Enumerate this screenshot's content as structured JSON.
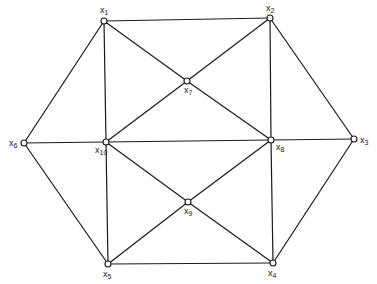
{
  "diagram": {
    "type": "graph",
    "nodes": [
      {
        "id": "x1",
        "label": "x",
        "sub": "1",
        "x": 104,
        "y": 21,
        "lx": 100,
        "ly": 13
      },
      {
        "id": "x2",
        "label": "x",
        "sub": "2",
        "x": 270,
        "y": 18,
        "lx": 266,
        "ly": 11
      },
      {
        "id": "x3",
        "label": "x",
        "sub": "3",
        "x": 354,
        "y": 139,
        "lx": 360,
        "ly": 143
      },
      {
        "id": "x4",
        "label": "x",
        "sub": "4",
        "x": 273,
        "y": 263,
        "lx": 268,
        "ly": 276
      },
      {
        "id": "x5",
        "label": "x",
        "sub": "5",
        "x": 108,
        "y": 264,
        "lx": 103,
        "ly": 277
      },
      {
        "id": "x6",
        "label": "x",
        "sub": "6",
        "x": 24,
        "y": 143,
        "lx": 9,
        "ly": 146
      },
      {
        "id": "x7",
        "label": "x",
        "sub": "7",
        "x": 187,
        "y": 81,
        "lx": 184,
        "ly": 93
      },
      {
        "id": "x8",
        "label": "x",
        "sub": "8",
        "x": 271,
        "y": 140,
        "lx": 276,
        "ly": 150
      },
      {
        "id": "x9",
        "label": "x",
        "sub": "9",
        "x": 188,
        "y": 202,
        "lx": 184,
        "ly": 214
      },
      {
        "id": "x10",
        "label": "x",
        "sub": "10",
        "x": 106,
        "y": 142,
        "lx": 95,
        "ly": 153
      }
    ],
    "edges": [
      [
        "x1",
        "x2"
      ],
      [
        "x2",
        "x3"
      ],
      [
        "x3",
        "x4"
      ],
      [
        "x4",
        "x5"
      ],
      [
        "x5",
        "x6"
      ],
      [
        "x6",
        "x1"
      ],
      [
        "x6",
        "x10"
      ],
      [
        "x10",
        "x8"
      ],
      [
        "x8",
        "x3"
      ],
      [
        "x1",
        "x10"
      ],
      [
        "x10",
        "x5"
      ],
      [
        "x2",
        "x8"
      ],
      [
        "x8",
        "x4"
      ],
      [
        "x1",
        "x7"
      ],
      [
        "x7",
        "x8"
      ],
      [
        "x2",
        "x7"
      ],
      [
        "x7",
        "x10"
      ],
      [
        "x10",
        "x9"
      ],
      [
        "x9",
        "x4"
      ],
      [
        "x8",
        "x9"
      ],
      [
        "x9",
        "x5"
      ]
    ]
  }
}
